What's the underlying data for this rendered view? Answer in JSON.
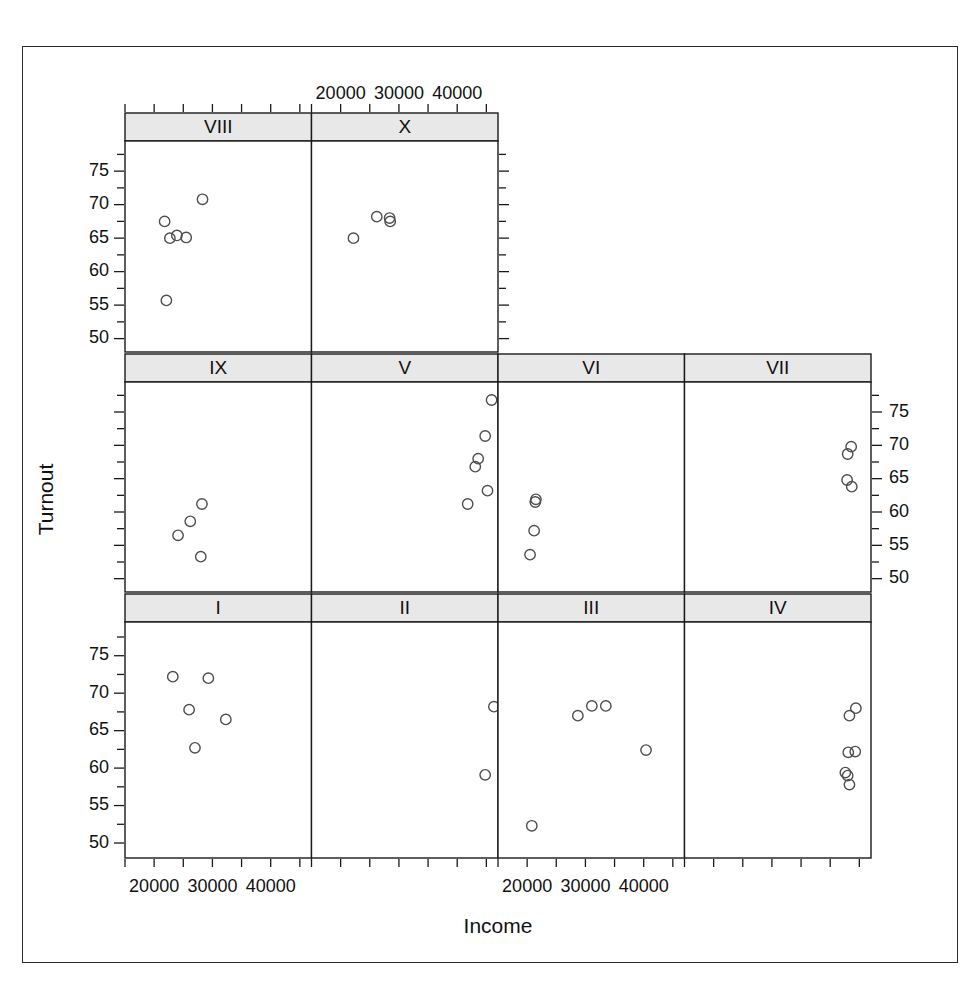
{
  "figure": {
    "type": "scatter-matrix",
    "xlabel": "Income",
    "ylabel": "Turnout",
    "panel_order_note": "3-row trellis; row1 has 2 panels, rows 2-3 have 4 panels each"
  },
  "axes": {
    "x_ticks_major": [
      20000,
      30000,
      40000
    ],
    "x_tick_labels": [
      "20000",
      "30000",
      "40000"
    ],
    "x_min": 15000,
    "x_max": 47000,
    "y_ticks_major": [
      50,
      55,
      60,
      65,
      70,
      75
    ],
    "y_tick_labels": [
      "50",
      "55",
      "60",
      "65",
      "70",
      "75"
    ],
    "y_min": 48.0,
    "y_max": 79.5,
    "x_minor_step": 5000,
    "y_minor_step": 2.5
  },
  "chart_data": {
    "type": "scatter",
    "title": "",
    "xlabel": "Income",
    "ylabel": "Turnout",
    "xlim": [
      15000,
      47000
    ],
    "ylim": [
      48,
      79.5
    ],
    "xticks": [
      20000,
      30000,
      40000
    ],
    "yticks": [
      50,
      55,
      60,
      65,
      70,
      75
    ],
    "grid": false,
    "legend": "none",
    "marker": "open-circle",
    "panels": [
      {
        "label": "VIII",
        "row": 1,
        "col": 1,
        "x_axis_side": "top",
        "y_axis_side": "left",
        "points": [
          {
            "x": 21800,
            "y": 67.5
          },
          {
            "x": 22700,
            "y": 65.0
          },
          {
            "x": 23900,
            "y": 65.4
          },
          {
            "x": 25500,
            "y": 65.1
          },
          {
            "x": 28300,
            "y": 70.8
          },
          {
            "x": 22100,
            "y": 55.7
          }
        ]
      },
      {
        "label": "X",
        "row": 1,
        "col": 2,
        "x_axis_side": "top",
        "y_axis_side": "right",
        "points": [
          {
            "x": 22200,
            "y": 65.0
          },
          {
            "x": 26200,
            "y": 68.2
          },
          {
            "x": 28400,
            "y": 68.0
          },
          {
            "x": 28500,
            "y": 67.5
          }
        ]
      },
      {
        "label": "IX",
        "row": 2,
        "col": 1,
        "x_axis_side": "none",
        "y_axis_side": "left",
        "points": [
          {
            "x": 24100,
            "y": 56.5
          },
          {
            "x": 26200,
            "y": 58.6
          },
          {
            "x": 28200,
            "y": 61.2
          },
          {
            "x": 28000,
            "y": 53.3
          }
        ]
      },
      {
        "label": "V",
        "row": 2,
        "col": 2,
        "x_axis_side": "none",
        "y_axis_side": "none",
        "points": [
          {
            "x": 41800,
            "y": 61.2
          },
          {
            "x": 43100,
            "y": 66.8
          },
          {
            "x": 43600,
            "y": 68.0
          },
          {
            "x": 44800,
            "y": 71.4
          },
          {
            "x": 45900,
            "y": 76.8
          },
          {
            "x": 45200,
            "y": 63.2
          }
        ]
      },
      {
        "label": "VI",
        "row": 2,
        "col": 3,
        "x_axis_side": "none",
        "y_axis_side": "none",
        "points": [
          {
            "x": 21400,
            "y": 61.5
          },
          {
            "x": 21500,
            "y": 61.9
          },
          {
            "x": 21200,
            "y": 57.2
          },
          {
            "x": 20500,
            "y": 53.6
          }
        ]
      },
      {
        "label": "VII",
        "row": 2,
        "col": 4,
        "x_axis_side": "none",
        "y_axis_side": "right",
        "points": [
          {
            "x": 43000,
            "y": 68.7
          },
          {
            "x": 43600,
            "y": 69.8
          },
          {
            "x": 42900,
            "y": 64.8
          },
          {
            "x": 43700,
            "y": 63.8
          }
        ]
      },
      {
        "label": "I",
        "row": 3,
        "col": 1,
        "x_axis_side": "bottom",
        "y_axis_side": "left",
        "points": [
          {
            "x": 23200,
            "y": 72.2
          },
          {
            "x": 26000,
            "y": 67.8
          },
          {
            "x": 27000,
            "y": 62.7
          },
          {
            "x": 29300,
            "y": 72.0
          },
          {
            "x": 32300,
            "y": 66.5
          }
        ]
      },
      {
        "label": "II",
        "row": 3,
        "col": 2,
        "x_axis_side": "none",
        "y_axis_side": "none",
        "points": [
          {
            "x": 44800,
            "y": 59.1
          },
          {
            "x": 46300,
            "y": 68.2
          }
        ]
      },
      {
        "label": "III",
        "row": 3,
        "col": 3,
        "x_axis_side": "bottom",
        "y_axis_side": "none",
        "points": [
          {
            "x": 20800,
            "y": 52.3
          },
          {
            "x": 28700,
            "y": 67.0
          },
          {
            "x": 31100,
            "y": 68.3
          },
          {
            "x": 33500,
            "y": 68.3
          },
          {
            "x": 40400,
            "y": 62.4
          }
        ]
      },
      {
        "label": "IV",
        "row": 3,
        "col": 4,
        "x_axis_side": "none",
        "y_axis_side": "none",
        "points": [
          {
            "x": 43300,
            "y": 67.0
          },
          {
            "x": 44400,
            "y": 68.0
          },
          {
            "x": 43100,
            "y": 62.1
          },
          {
            "x": 44300,
            "y": 62.2
          },
          {
            "x": 42600,
            "y": 59.4
          },
          {
            "x": 43000,
            "y": 59.0
          },
          {
            "x": 43300,
            "y": 57.8
          }
        ]
      }
    ]
  }
}
